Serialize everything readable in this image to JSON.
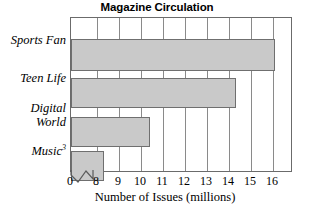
{
  "chart_data": {
    "type": "bar",
    "orientation": "horizontal",
    "title": "Magazine Circulation",
    "xlabel": "Number of Issues (millions)",
    "ylabel": "",
    "categories": [
      "Sports Fan",
      "Teen Life",
      "Digital World",
      "Music"
    ],
    "category_display": [
      "Sports Fan",
      "Teen Life",
      "Digital|World",
      "Music^3"
    ],
    "values": [
      16.1,
      14.3,
      10.4,
      8.3
    ],
    "xlim": [
      8,
      16.9
    ],
    "xticks": [
      0,
      8,
      9,
      10,
      11,
      12,
      13,
      14,
      15,
      16
    ],
    "xtick_labels": [
      "0",
      "8",
      "9",
      "10",
      "11",
      "12",
      "13",
      "14",
      "15",
      "16"
    ],
    "axis_break": true,
    "axis_break_between": [
      0,
      8
    ],
    "grid": "vertical",
    "legend": "none",
    "bar_fill_color": "#c9c9c9",
    "bar_border_color": "#6f6f6f",
    "frame_color": "#6b6b6b",
    "gridline_color": "#8a8a8a",
    "background_color": "#ffffff"
  },
  "labels": {
    "title": "Magazine Circulation",
    "axis_title": "Number of Issues (millions)",
    "cat0": "Sports Fan",
    "cat1": "Teen Life",
    "cat2_line1": "Digital",
    "cat2_line2": "World",
    "cat3_base": "Music",
    "cat3_sup": "3",
    "tick0": "0",
    "tick1": "8",
    "tick2": "9",
    "tick3": "10",
    "tick4": "11",
    "tick5": "12",
    "tick6": "13",
    "tick7": "14",
    "tick8": "15",
    "tick9": "16"
  }
}
